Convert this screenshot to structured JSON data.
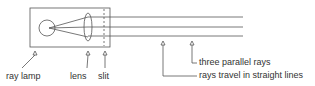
{
  "labels": {
    "lamp": "ray lamp",
    "lens": "lens",
    "slit": "slit",
    "parallel": "three parallel rays",
    "straight": "rays travel in straight lines"
  }
}
